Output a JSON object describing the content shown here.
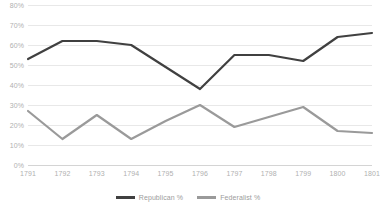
{
  "chart_data": {
    "type": "line",
    "title": "",
    "xlabel": "",
    "ylabel": "",
    "categories": [
      "1791",
      "1792",
      "1793",
      "1794",
      "1795",
      "1796",
      "1797",
      "1798",
      "1799",
      "1800",
      "1801"
    ],
    "series": [
      {
        "name": "Republican %",
        "color": "#404040",
        "values": [
          53,
          62,
          62,
          60,
          49,
          38,
          55,
          55,
          52,
          64,
          66
        ]
      },
      {
        "name": "Federalist %",
        "color": "#9a9a9a",
        "values": [
          27,
          13,
          25,
          13,
          22,
          30,
          19,
          24,
          29,
          17,
          16
        ]
      }
    ],
    "ylim": [
      0,
      80
    ],
    "ytick_values": [
      0,
      10,
      20,
      30,
      40,
      50,
      60,
      70,
      80
    ],
    "ytick_labels": [
      "0%",
      "10%",
      "20%",
      "30%",
      "40%",
      "50%",
      "60%",
      "70%",
      "80%"
    ],
    "grid": true,
    "grid_color": "#e8e8e8",
    "legend_position": "bottom",
    "background_color": "#ffffff",
    "tick_label_color": "#b0b0b0"
  }
}
